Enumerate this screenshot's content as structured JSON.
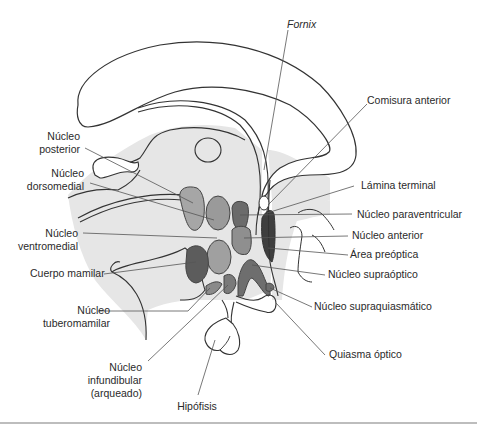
{
  "figure": {
    "colors": {
      "tissue_fill": "#e6e6e6",
      "outline": "#333333",
      "leader_line": "#555555",
      "nucleus_light": "#a9a9a9",
      "nucleus_mid": "#8f8f8f",
      "nucleus_dark": "#5c5c5c",
      "preoptic_dark": "#3f3f3f",
      "rule": "#bdbdbd"
    }
  },
  "labels": {
    "fornix": "Fornix",
    "comisura_anterior": "Comisura anterior",
    "nucleo_posterior": [
      "Núcleo",
      "posterior"
    ],
    "nucleo_dorsomedial": [
      "Núcleo",
      "dorsomedial"
    ],
    "lamina_terminal": "Lámina terminal",
    "nucleo_paraventricular": "Núcleo paraventricular",
    "nucleo_ventromedial": [
      "Núcleo",
      "ventromedial"
    ],
    "nucleo_anterior": "Núcleo anterior",
    "area_preoptica": "Área preóptica",
    "cuerpo_mamilar": "Cuerpo mamilar",
    "nucleo_supraoptico": "Núcleo supraóptico",
    "nucleo_tuberomamilar": [
      "Núcleo",
      "tuberomamilar"
    ],
    "nucleo_supraquiasmatico": "Núcleo supraquiasmático",
    "nucleo_infundibular": [
      "Núcleo",
      "infundibular",
      "(arqueado)"
    ],
    "quiasma_optico": "Quiasma óptico",
    "hipofisis": "Hipófisis"
  }
}
